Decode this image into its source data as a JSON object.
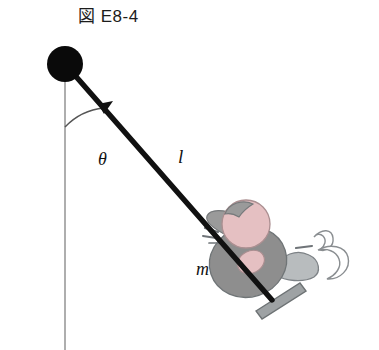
{
  "figure": {
    "caption": "図 E8-4",
    "labels": {
      "angle": "θ",
      "length": "l",
      "mass": "m"
    },
    "colors": {
      "pivot": "#0a0a0a",
      "rope": "#111111",
      "vertical_reference": "#9a9a9a",
      "skin_pink": "#e5c0c2",
      "body_gray": "#8e8e8e",
      "seat_gray": "#b8bcbe",
      "outline_gray": "#7d8286",
      "background": "#ffffff"
    },
    "geometry": {
      "pivot_center": [
        65,
        64
      ],
      "pivot_radius": 18,
      "rope_end": [
        272,
        300
      ],
      "vertical_line_top": [
        65,
        64
      ],
      "vertical_line_bottom": [
        65,
        350
      ],
      "angle_arc_radius": 62,
      "angle_degrees": 45
    },
    "elements": {
      "pivot": "pivot-bob",
      "rope": "pendulum-rope",
      "vertical": "vertical-reference-line",
      "angle_arc": "angle-arc",
      "swinger": "child-on-swing",
      "seat": "swing-seat-board"
    }
  }
}
